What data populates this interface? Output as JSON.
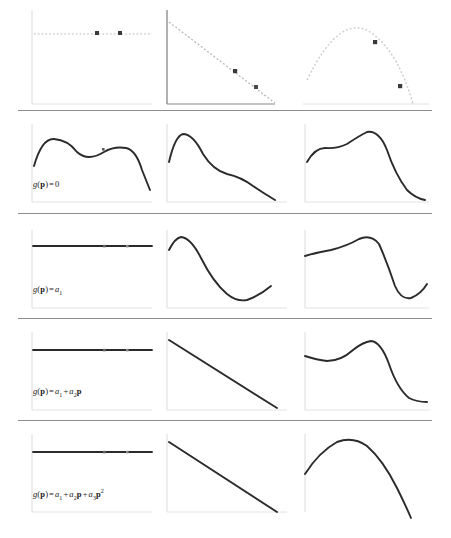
{
  "figure": {
    "title": "",
    "rows": [
      {
        "id": "row-1",
        "label": "",
        "label_visible": false,
        "top": 8,
        "height": 102,
        "separator_y": 110,
        "panels": [
          {
            "id": "r1c1",
            "name": "panel-constant-drift-data",
            "curve_type": "dotted-horizontal",
            "marker_count": 2,
            "axis_style": "light"
          },
          {
            "id": "r1c2",
            "name": "panel-linear-drift-data",
            "curve_type": "dotted-descending-line",
            "marker_count": 2,
            "axis_style": "dark"
          },
          {
            "id": "r1c3",
            "name": "panel-quadratic-drift-data",
            "curve_type": "dotted-parabola",
            "marker_count": 2,
            "axis_style": "none"
          }
        ]
      },
      {
        "id": "row-2",
        "label_parts": {
          "lhs": "g",
          "arg": "p",
          "eq": "=",
          "rhs": "0"
        },
        "label_plain": "g(p) = 0",
        "label_visible": true,
        "top": 122,
        "height": 86,
        "separator_y": 213,
        "panels": [
          {
            "id": "r2c1",
            "name": "panel-krig-constant-col1",
            "curve_type": "wavy-plateau-drop"
          },
          {
            "id": "r2c2",
            "name": "panel-krig-constant-col2",
            "curve_type": "peak-then-decline"
          },
          {
            "id": "r2c3",
            "name": "panel-krig-constant-col3",
            "curve_type": "rise-peak-steep-drop"
          }
        ]
      },
      {
        "id": "row-3",
        "label_parts": {
          "lhs": "g",
          "arg": "p",
          "eq": "=",
          "rhs": "a",
          "rhs_sub": "1"
        },
        "label_plain": "g(p) = a1",
        "label_visible": true,
        "top": 228,
        "height": 86,
        "separator_y": 318,
        "panels": [
          {
            "id": "r3c1",
            "name": "panel-krig-a1-col1",
            "curve_type": "flat-horizontal"
          },
          {
            "id": "r3c2",
            "name": "panel-krig-a1-col2",
            "curve_type": "peak-dip-recover"
          },
          {
            "id": "r3c3",
            "name": "panel-krig-a1-col3",
            "curve_type": "rise-peak-dip-recover"
          }
        ]
      },
      {
        "id": "row-4",
        "label_plain": "g(p) = a1 + a2p",
        "label_visible": true,
        "top": 330,
        "height": 86,
        "separator_y": 420,
        "panels": [
          {
            "id": "r4c1",
            "name": "panel-krig-linear-col1",
            "curve_type": "flat-horizontal"
          },
          {
            "id": "r4c2",
            "name": "panel-krig-linear-col2",
            "curve_type": "straight-descending"
          },
          {
            "id": "r4c3",
            "name": "panel-krig-linear-col3",
            "curve_type": "bump-peak-drop-flat"
          }
        ]
      },
      {
        "id": "row-5",
        "label_plain": "g(p) = a1 + a2p + a3p2",
        "label_visible": true,
        "top": 432,
        "height": 86,
        "separator_y": 0,
        "panels": [
          {
            "id": "r5c1",
            "name": "panel-krig-quadratic-col1",
            "curve_type": "flat-horizontal"
          },
          {
            "id": "r5c2",
            "name": "panel-krig-quadratic-col2",
            "curve_type": "straight-descending"
          },
          {
            "id": "r5c3",
            "name": "panel-krig-quadratic-col3",
            "curve_type": "parabola-arc"
          }
        ]
      }
    ],
    "columns": [
      {
        "index": 1,
        "left": 30,
        "width": 118
      },
      {
        "index": 2,
        "left": 165,
        "width": 125
      },
      {
        "index": 3,
        "left": 303,
        "width": 125
      }
    ],
    "colors": {
      "curve_dark": "#2b2b2b",
      "curve_dotted": "#c9c9c9",
      "axis_light": "#d8d8d8",
      "axis_dark": "#6b6b6b",
      "separator": "#8d8d8d",
      "marker": "#3a3a3a",
      "label_text": "#1a1a1a",
      "background": "#ffffff"
    }
  }
}
